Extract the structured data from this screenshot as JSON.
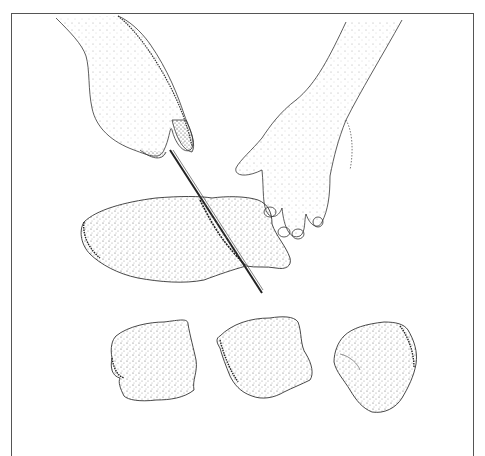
{
  "illustration": {
    "subject": "Hands slicing a fish fillet into three portions with a knife",
    "elements": {
      "left_hand": "hand-holding-knife",
      "right_hand": "hand-steadying-fillet",
      "knife": "slicing-knife",
      "fillet": "whole-fillet",
      "portions": [
        "portion-1",
        "portion-2",
        "portion-3"
      ]
    },
    "colors": {
      "ink": "#222222",
      "stipple": "#555555",
      "background": "#ffffff",
      "frame": "#555555"
    }
  }
}
